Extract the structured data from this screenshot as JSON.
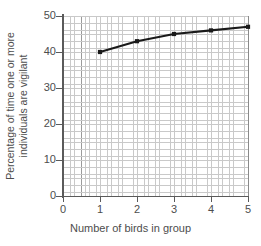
{
  "chart_data": {
    "type": "line",
    "title": "",
    "xlabel": "Number of birds in group",
    "ylabel": "Percentage of time one or more individuals are vigilant",
    "ylabel_line1": "Percentage of time one or more",
    "ylabel_line2": "individuals are vigilant",
    "x": [
      1,
      2,
      3,
      4,
      5
    ],
    "values": [
      40,
      43,
      45,
      46,
      47
    ],
    "series": [
      {
        "name": "Percentage of time one or more individuals are vigilant",
        "values": [
          40,
          43,
          45,
          46,
          47
        ],
        "color": "#1a1a1a",
        "marker": "square"
      }
    ],
    "xlim": [
      0,
      5
    ],
    "ylim": [
      0,
      50
    ],
    "xticks": [
      0,
      1,
      2,
      3,
      4,
      5
    ],
    "yticks": [
      0,
      10,
      20,
      30,
      40,
      50
    ],
    "xtick_labels": [
      "0",
      "1",
      "2",
      "3",
      "4",
      "5"
    ],
    "ytick_labels": [
      "0",
      "10",
      "20",
      "30",
      "40",
      "50"
    ],
    "grid": true,
    "grid_minor": true,
    "legend": false,
    "legend_position": "none",
    "background": "#ffffff",
    "grid_color": "#c9c9c9",
    "grid_major_color": "#9a9a9a",
    "axis_color": "#5a5a5a",
    "text_color": "#4d4d4d"
  }
}
